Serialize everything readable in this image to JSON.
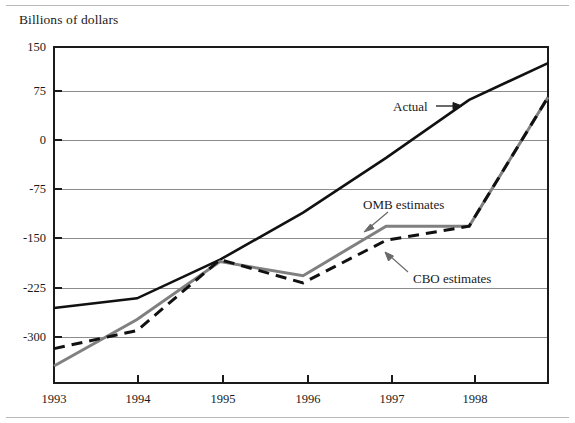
{
  "figure": {
    "axis_title": "Billions of dollars",
    "has_top_rule": true,
    "has_bottom_rule": true
  },
  "annotations": {
    "actual": "Actual",
    "omb": "OMB estimates",
    "cbo": "CBO estimates"
  },
  "colors": {
    "actual_line": "#111111",
    "cbo_line": "#111111",
    "omb_line": "#808080",
    "grid": "#8c8c8c",
    "frame": "#1a1a1a",
    "text": "#1a1a1a",
    "rule": "#b9b9b9"
  },
  "chart_data": {
    "type": "line",
    "title": "",
    "subtitle": "",
    "xlabel": "",
    "ylabel": "Billions of dollars",
    "xlim": [
      1993,
      1998.95
    ],
    "ylim": [
      -337,
      150
    ],
    "grid": true,
    "grid_axis": "y",
    "legend": "none",
    "x_ticks": [
      1993,
      1994,
      1995,
      1996,
      1997,
      1998
    ],
    "x_tick_labels": [
      "1993",
      "1994",
      "1995",
      "1996",
      "1997",
      "1998"
    ],
    "y_ticks": [
      150,
      75,
      0,
      -75,
      -150,
      -225,
      -300
    ],
    "y_tick_labels": [
      "150",
      "75",
      "0",
      "-75",
      "-150",
      "-225",
      "-300"
    ],
    "x": [
      1993,
      1994,
      1995,
      1996,
      1997,
      1998,
      1998.95
    ],
    "series": [
      {
        "name": "Actual",
        "style": "solid",
        "color": "#111111",
        "width": 2.6,
        "values": [
          -255,
          -240,
          -180,
          -107,
          -22,
          68,
          125
        ]
      },
      {
        "name": "OMB estimates",
        "style": "solid",
        "color": "#808080",
        "width": 3.0,
        "values": [
          -345,
          -273,
          -183,
          -205,
          -128,
          -128,
          72
        ]
      },
      {
        "name": "CBO estimates",
        "style": "dashed",
        "color": "#111111",
        "width": 3.0,
        "values": [
          -318,
          -290,
          -180,
          -216,
          -150,
          -128,
          72
        ]
      }
    ]
  }
}
